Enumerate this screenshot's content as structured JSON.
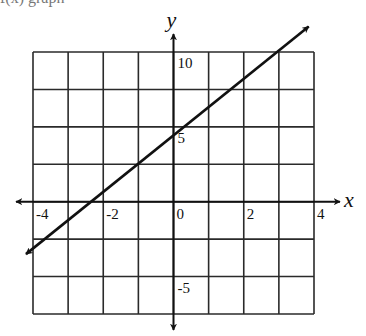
{
  "caption_cut": "f(x) graph",
  "chart_data": {
    "type": "line",
    "title": "",
    "xlabel": "x",
    "ylabel": "y",
    "xlim": [
      -4,
      4
    ],
    "ylim": [
      -7.5,
      10
    ],
    "grid": true,
    "grid_x_step": 1,
    "grid_y_step": 2.5,
    "x_tick_labels": [
      {
        "value": -4,
        "label": "-4"
      },
      {
        "value": -2,
        "label": "-2"
      },
      {
        "value": 0,
        "label": "0"
      },
      {
        "value": 2,
        "label": "2"
      },
      {
        "value": 4,
        "label": "4"
      }
    ],
    "y_tick_labels": [
      {
        "value": 10,
        "label": "10"
      },
      {
        "value": 5,
        "label": "5"
      },
      {
        "value": -5,
        "label": "-5"
      }
    ],
    "series": [
      {
        "name": "line",
        "arrows_both_ends": true,
        "points": [
          {
            "x": -4.2,
            "y": -3.5
          },
          {
            "x": -2.4,
            "y": 0
          },
          {
            "x": 0,
            "y": 4.6
          },
          {
            "x": 2.95,
            "y": 10
          },
          {
            "x": 3.85,
            "y": 11.7
          }
        ]
      }
    ],
    "colors": {
      "grid": "#2a2a2a",
      "axes": "#111111",
      "line": "#111111"
    }
  }
}
